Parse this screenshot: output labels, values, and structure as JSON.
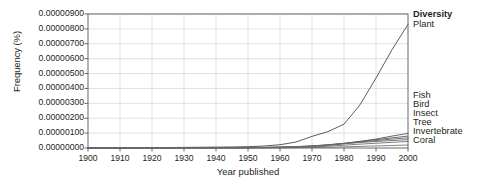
{
  "chart_data": {
    "type": "line",
    "title": "",
    "xlabel": "Year published",
    "ylabel": "Frequency (%)",
    "xlim": [
      1900,
      2000
    ],
    "ylim": [
      0,
      9e-06
    ],
    "grid": true,
    "legend_position": "right",
    "legend_header": "Diversity",
    "x_ticks": [
      1900,
      1910,
      1920,
      1930,
      1940,
      1950,
      1960,
      1970,
      1980,
      1990,
      2000
    ],
    "x_tick_labels": [
      "1900",
      "1910",
      "1920",
      "1930",
      "1940",
      "1950",
      "1960",
      "1970",
      "1980",
      "1990",
      "2000"
    ],
    "y_ticks": [
      0,
      1e-06,
      2e-06,
      3e-06,
      4e-06,
      5e-06,
      6e-06,
      7e-06,
      8e-06,
      9e-06
    ],
    "y_tick_labels": [
      "0.00000000",
      "0.00000100",
      "0.00000200",
      "0.00000300",
      "0.00000400",
      "0.00000500",
      "0.00000600",
      "0.00000700",
      "0.00000800",
      "0.00000900"
    ],
    "x": [
      1900,
      1905,
      1910,
      1915,
      1920,
      1925,
      1930,
      1935,
      1940,
      1945,
      1950,
      1955,
      1960,
      1965,
      1970,
      1975,
      1980,
      1985,
      1990,
      1995,
      2000
    ],
    "series": [
      {
        "name": "Plant",
        "color": "#4a4a4a",
        "values": [
          0.0,
          1e-08,
          2e-08,
          2e-08,
          3e-08,
          3e-08,
          4e-08,
          5e-08,
          6e-08,
          7e-08,
          9e-08,
          1.3e-07,
          2.2e-07,
          4e-07,
          7.8e-07,
          1.1e-06,
          1.6e-06,
          2.9e-06,
          4.7e-06,
          6.6e-06,
          8.3e-06
        ]
      },
      {
        "name": "Fish",
        "color": "#555555",
        "values": [
          0.0,
          0.0,
          1e-08,
          1e-08,
          1e-08,
          1e-08,
          2e-08,
          2e-08,
          2e-08,
          2e-08,
          3e-08,
          4e-08,
          6e-08,
          9e-08,
          1.4e-07,
          2e-07,
          3e-07,
          4.4e-07,
          6e-07,
          8e-07,
          9.8e-07
        ]
      },
      {
        "name": "Bird",
        "color": "#5c5c5c",
        "values": [
          0.0,
          0.0,
          1e-08,
          1e-08,
          1e-08,
          1e-08,
          2e-08,
          2e-08,
          2e-08,
          2e-08,
          3e-08,
          4e-08,
          6e-08,
          9e-08,
          1.4e-07,
          2.2e-07,
          3.2e-07,
          4.4e-07,
          5.6e-07,
          6.8e-07,
          8e-07
        ]
      },
      {
        "name": "Insect",
        "color": "#636363",
        "values": [
          0.0,
          0.0,
          1e-08,
          1e-08,
          1e-08,
          1e-08,
          1e-08,
          2e-08,
          2e-08,
          2e-08,
          2e-08,
          3e-08,
          5e-08,
          7e-08,
          1.2e-07,
          2e-07,
          3e-07,
          4e-07,
          5e-07,
          6e-07,
          6.8e-07
        ]
      },
      {
        "name": "Tree",
        "color": "#6a6a6a",
        "values": [
          0.0,
          0.0,
          0.0,
          1e-08,
          1e-08,
          1e-08,
          1e-08,
          1e-08,
          2e-08,
          2e-08,
          2e-08,
          3e-08,
          4e-08,
          6e-08,
          1e-07,
          1.8e-07,
          2.8e-07,
          3.7e-07,
          4.4e-07,
          5e-07,
          5.6e-07
        ]
      },
      {
        "name": "Invertebrate",
        "color": "#717171",
        "values": [
          0.0,
          0.0,
          0.0,
          0.0,
          0.0,
          1e-08,
          1e-08,
          1e-08,
          1e-08,
          1e-08,
          1e-08,
          2e-08,
          3e-08,
          4e-08,
          7e-08,
          1.2e-07,
          1.9e-07,
          2.6e-07,
          3.2e-07,
          3.8e-07,
          4.4e-07
        ]
      },
      {
        "name": "Coral",
        "color": "#787878",
        "values": [
          0.0,
          0.0,
          0.0,
          0.0,
          0.0,
          0.0,
          0.0,
          0.0,
          0.0,
          0.0,
          1e-08,
          1e-08,
          1e-08,
          2e-08,
          3e-08,
          5e-08,
          8e-08,
          1.1e-07,
          1.4e-07,
          1.7e-07,
          2e-07
        ]
      }
    ],
    "legend_entries": [
      {
        "label": "Plant",
        "y_px": 25
      },
      {
        "label": "Fish",
        "y_px": 96
      },
      {
        "label": "Bird",
        "y_px": 105
      },
      {
        "label": "Insect",
        "y_px": 114
      },
      {
        "label": "Tree",
        "y_px": 123
      },
      {
        "label": "Invertebrate",
        "y_px": 132
      },
      {
        "label": "Coral",
        "y_px": 141
      }
    ],
    "colors": {
      "axis": "#58595b",
      "grid": "#d9d9d9",
      "text": "#231f20",
      "background": "#ffffff"
    }
  }
}
